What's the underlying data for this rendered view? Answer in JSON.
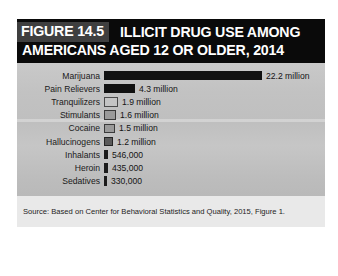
{
  "figure": {
    "tag": "FIGURE 14.5",
    "title_line_1": "ILLICIT DRUG USE AMONG",
    "title_line_2": "AMERICANS AGED 12 OR OLDER, 2014",
    "source": "Source: Based on Center for Behavioral Statistics and Quality, 2015, Figure 1."
  },
  "colors": {
    "title_band": "#0a0a0a",
    "tag_background": "#3f3f3f",
    "panel_background": "#c2c2c2",
    "bar_solid": "#111111",
    "bar_hollow": "#c4c4c4",
    "source_band": "#e9e9e9",
    "text": "#1a1a1a"
  },
  "chart_data": {
    "type": "bar",
    "orientation": "horizontal",
    "title": "FIGURE 14.5 ILLICIT DRUG USE AMONG AMERICANS AGED 12 OR OLDER, 2014",
    "xlabel": "",
    "ylabel": "",
    "grid": false,
    "legend": false,
    "xlim": [
      0,
      22200000
    ],
    "categories": [
      "Marijuana",
      "Pain Relievers",
      "Tranquilizers",
      "Stimulants",
      "Cocaine",
      "Hallucinogens",
      "Inhalants",
      "Heroin",
      "Sedatives"
    ],
    "values": [
      22200000,
      4300000,
      1900000,
      1600000,
      1500000,
      1200000,
      546000,
      435000,
      330000
    ],
    "value_labels": [
      "22.2 million",
      "4.3 million",
      "1.9 million",
      "1.6 million",
      "1.5 million",
      "1.2 million",
      "546,000",
      "435,000",
      "330,000"
    ],
    "source": "Source: Based on Center for Behavioral Statistics and Quality, 2015, Figure 1."
  },
  "rows": [
    {
      "label": "Marijuana",
      "value_label": "22.2 million",
      "width_px": 158,
      "style": "solid"
    },
    {
      "label": "Pain Relievers",
      "value_label": "4.3 million",
      "width_px": 31,
      "style": "solid"
    },
    {
      "label": "Tranquilizers",
      "value_label": "1.9 million",
      "width_px": 14,
      "style": "hollow"
    },
    {
      "label": "Stimulants",
      "value_label": "1.6 million",
      "width_px": 12,
      "style": "hollow-mid"
    },
    {
      "label": "Cocaine",
      "value_label": "1.5 million",
      "width_px": 11,
      "style": "hollow-mid"
    },
    {
      "label": "Hallucinogens",
      "value_label": "1.2 million",
      "width_px": 9,
      "style": "hollow-dark"
    },
    {
      "label": "Inhalants",
      "value_label": "546,000",
      "width_px": 4,
      "style": "sliver"
    },
    {
      "label": "Heroin",
      "value_label": "435,000",
      "width_px": 4,
      "style": "sliver"
    },
    {
      "label": "Sedatives",
      "value_label": "330,000",
      "width_px": 3,
      "style": "sliver"
    }
  ]
}
